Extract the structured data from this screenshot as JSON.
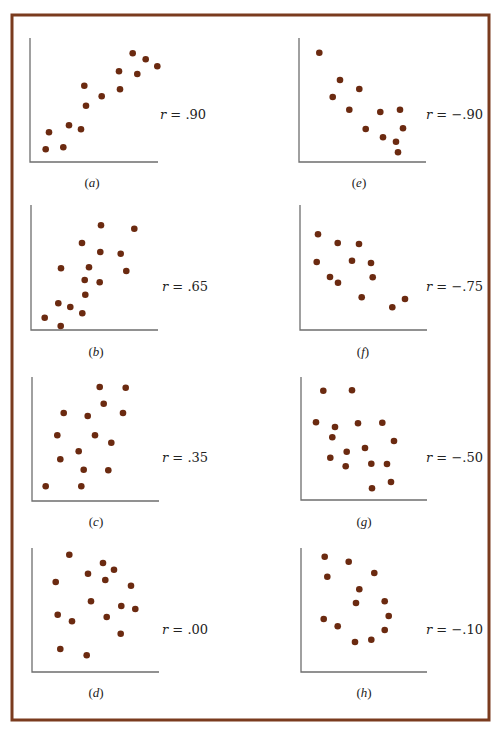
{
  "figure": {
    "frame": {
      "x": 12,
      "y": 15,
      "width": 477,
      "height": 705,
      "color": "#7a3b1e"
    },
    "dot_color": "#6b2a10",
    "axis_color": "#6e6e6e",
    "dot_radius": 3.3
  },
  "chart_data": [
    {
      "type": "scatter",
      "id": "a",
      "panel_label": "(a)",
      "r_label": "r = .90",
      "r_value": 0.9,
      "axes": {
        "x0": 30,
        "y_top": 38,
        "y0": 162,
        "x_end": 158
      },
      "label_pos": {
        "x": 92,
        "y": 187
      },
      "r_pos": {
        "x": 160,
        "y": 119
      },
      "points": [
        [
          45.7,
          149.3
        ],
        [
          49,
          132.3
        ],
        [
          63.3,
          147.3
        ],
        [
          69,
          125.3
        ],
        [
          81,
          129.3
        ],
        [
          84.3,
          85.7
        ],
        [
          86,
          105.7
        ],
        [
          101.7,
          96.3
        ],
        [
          119,
          71.3
        ],
        [
          120,
          89.3
        ],
        [
          132.7,
          53.3
        ],
        [
          137.3,
          74
        ],
        [
          145.7,
          59.3
        ],
        [
          157.3,
          66.3
        ]
      ]
    },
    {
      "type": "scatter",
      "id": "e",
      "panel_label": "(e)",
      "r_label": "r = −.90",
      "r_value": -0.9,
      "axes": {
        "x0": 299,
        "y_top": 38,
        "y0": 162,
        "x_end": 426
      },
      "label_pos": {
        "x": 359,
        "y": 187
      },
      "r_pos": {
        "x": 426,
        "y": 119
      },
      "points": [
        [
          319.3,
          52.7
        ],
        [
          340,
          80
        ],
        [
          359.3,
          89
        ],
        [
          332.7,
          97
        ],
        [
          349.3,
          109.7
        ],
        [
          380.3,
          112
        ],
        [
          400,
          109.7
        ],
        [
          365.7,
          129
        ],
        [
          403,
          128.3
        ],
        [
          383,
          137.3
        ],
        [
          396,
          141.7
        ],
        [
          398,
          152.3
        ]
      ]
    },
    {
      "type": "scatter",
      "id": "b",
      "panel_label": "(b)",
      "r_label": "r = .65",
      "r_value": 0.65,
      "axes": {
        "x0": 31,
        "y_top": 205,
        "y0": 330,
        "x_end": 158
      },
      "label_pos": {
        "x": 96,
        "y": 356
      },
      "r_pos": {
        "x": 162,
        "y": 291
      },
      "points": [
        [
          101,
          225.3
        ],
        [
          134.3,
          228.7
        ],
        [
          82,
          243
        ],
        [
          100.3,
          252
        ],
        [
          120.7,
          253.7
        ],
        [
          61,
          268.3
        ],
        [
          89,
          267.3
        ],
        [
          126.3,
          271
        ],
        [
          84.7,
          280
        ],
        [
          99.7,
          282.3
        ],
        [
          85.3,
          294.7
        ],
        [
          58.3,
          303.3
        ],
        [
          70.3,
          307
        ],
        [
          82.3,
          313.3
        ],
        [
          44.7,
          317.7
        ],
        [
          60.7,
          326
        ]
      ]
    },
    {
      "type": "scatter",
      "id": "f",
      "panel_label": "(f)",
      "r_label": "r = −.75",
      "r_value": -0.75,
      "axes": {
        "x0": 300,
        "y_top": 205,
        "y0": 330,
        "x_end": 427
      },
      "label_pos": {
        "x": 363,
        "y": 356
      },
      "r_pos": {
        "x": 426,
        "y": 291
      },
      "points": [
        [
          318,
          234.3
        ],
        [
          337.7,
          243
        ],
        [
          359,
          244
        ],
        [
          316.7,
          262
        ],
        [
          352,
          260.7
        ],
        [
          371,
          263
        ],
        [
          330,
          277
        ],
        [
          338,
          282.7
        ],
        [
          372.7,
          277.3
        ],
        [
          361.7,
          297.3
        ],
        [
          405,
          299
        ],
        [
          392.3,
          307.3
        ]
      ]
    },
    {
      "type": "scatter",
      "id": "c",
      "panel_label": "(c)",
      "r_label": "r = .35",
      "r_value": 0.35,
      "axes": {
        "x0": 32,
        "y_top": 377,
        "y0": 501,
        "x_end": 159
      },
      "label_pos": {
        "x": 96,
        "y": 526
      },
      "r_pos": {
        "x": 162,
        "y": 462
      },
      "points": [
        [
          99.7,
          387
        ],
        [
          125.7,
          387.7
        ],
        [
          103.7,
          403.7
        ],
        [
          63.7,
          413
        ],
        [
          87.7,
          416
        ],
        [
          123,
          413
        ],
        [
          57.3,
          435.3
        ],
        [
          95,
          435.3
        ],
        [
          111.3,
          442.7
        ],
        [
          78.7,
          451.3
        ],
        [
          60.3,
          459.3
        ],
        [
          83.7,
          469.7
        ],
        [
          108.3,
          470.3
        ],
        [
          45.7,
          486.3
        ],
        [
          81.3,
          486.3
        ]
      ]
    },
    {
      "type": "scatter",
      "id": "g",
      "panel_label": "(g)",
      "r_label": "r = −.50",
      "r_value": -0.5,
      "axes": {
        "x0": 301,
        "y_top": 377,
        "y0": 500,
        "x_end": 427
      },
      "label_pos": {
        "x": 364,
        "y": 526
      },
      "r_pos": {
        "x": 426,
        "y": 462
      },
      "points": [
        [
          323.3,
          390.7
        ],
        [
          352,
          390.3
        ],
        [
          316,
          422.3
        ],
        [
          335,
          427
        ],
        [
          358,
          423.3
        ],
        [
          382.3,
          422.7
        ],
        [
          332.3,
          437.3
        ],
        [
          394,
          441
        ],
        [
          365,
          448
        ],
        [
          346.7,
          451.7
        ],
        [
          330.3,
          457.7
        ],
        [
          345.7,
          466.3
        ],
        [
          371.3,
          463.7
        ],
        [
          387,
          464
        ],
        [
          391,
          482
        ],
        [
          372,
          488.3
        ]
      ]
    },
    {
      "type": "scatter",
      "id": "d",
      "panel_label": "(d)",
      "r_label": "r = .00",
      "r_value": 0.0,
      "axes": {
        "x0": 32,
        "y_top": 548,
        "y0": 672,
        "x_end": 159
      },
      "label_pos": {
        "x": 96,
        "y": 697
      },
      "r_pos": {
        "x": 162,
        "y": 634
      },
      "points": [
        [
          69.3,
          554.7
        ],
        [
          103,
          563
        ],
        [
          114,
          569.7
        ],
        [
          88,
          573.7
        ],
        [
          105.3,
          580
        ],
        [
          55.7,
          582
        ],
        [
          131,
          585.7
        ],
        [
          91,
          601.3
        ],
        [
          121.3,
          606
        ],
        [
          135.3,
          609
        ],
        [
          57.7,
          614.7
        ],
        [
          106.7,
          617
        ],
        [
          72,
          621.3
        ],
        [
          120.7,
          633.7
        ],
        [
          60.3,
          649
        ],
        [
          86.7,
          655.3
        ]
      ]
    },
    {
      "type": "scatter",
      "id": "h",
      "panel_label": "(h)",
      "r_label": "r = −.10",
      "r_value": -0.1,
      "axes": {
        "x0": 301,
        "y_top": 548,
        "y0": 672,
        "x_end": 427
      },
      "label_pos": {
        "x": 364,
        "y": 697
      },
      "r_pos": {
        "x": 426,
        "y": 634
      },
      "points": [
        [
          324.7,
          556.7
        ],
        [
          348.7,
          561.7
        ],
        [
          327.3,
          576.7
        ],
        [
          374.3,
          573
        ],
        [
          359.3,
          589.3
        ],
        [
          356,
          603
        ],
        [
          384.7,
          601.3
        ],
        [
          388.7,
          616
        ],
        [
          323.7,
          619
        ],
        [
          337.7,
          626.3
        ],
        [
          384.7,
          630
        ],
        [
          371.3,
          639.7
        ],
        [
          355,
          642
        ]
      ]
    }
  ]
}
